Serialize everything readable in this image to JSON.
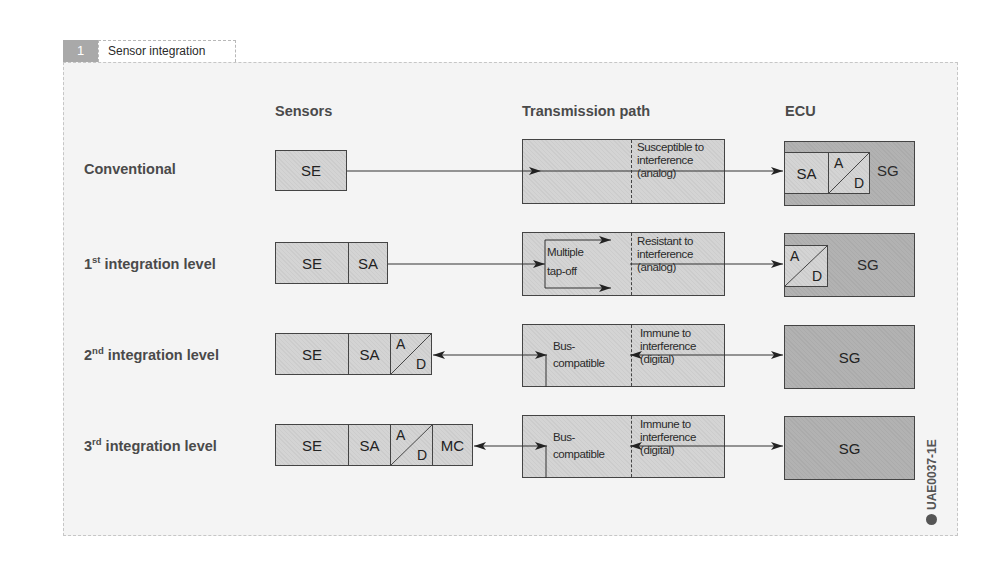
{
  "figure": {
    "number": "1",
    "title": "Sensor integration levels",
    "code": "UAE0037-1E"
  },
  "columns": {
    "sensors": "Sensors",
    "transmission": "Transmission path",
    "ecu": "ECU"
  },
  "rows": [
    {
      "label": "Conventional",
      "label_sup": "",
      "label_rest": "",
      "sensor_cells": [
        "SE"
      ],
      "transmission": {
        "left_text": "",
        "right_text": [
          "Susceptible to",
          "interference",
          "(analog)"
        ]
      },
      "ecu_cells": [
        "SA",
        "A/D",
        "SG"
      ]
    },
    {
      "label": "1",
      "label_sup": "st",
      "label_rest": " integration level",
      "sensor_cells": [
        "SE",
        "SA"
      ],
      "transmission": {
        "left_text": [
          "Multiple",
          "tap-off"
        ],
        "right_text": [
          "Resistant to",
          "interference",
          "(analog)"
        ]
      },
      "ecu_cells": [
        "A/D",
        "SG"
      ]
    },
    {
      "label": "2",
      "label_sup": "nd",
      "label_rest": " integration level",
      "sensor_cells": [
        "SE",
        "SA",
        "A/D"
      ],
      "transmission": {
        "left_text": [
          "Bus-",
          "compatible"
        ],
        "right_text": [
          "Immune to",
          "interference",
          "(digital)"
        ]
      },
      "ecu_cells": [
        "SG"
      ]
    },
    {
      "label": "3",
      "label_sup": "rd",
      "label_rest": " integration level",
      "sensor_cells": [
        "SE",
        "SA",
        "A/D",
        "MC"
      ],
      "transmission": {
        "left_text": [
          "Bus-",
          "compatible"
        ],
        "right_text": [
          "Immune to",
          "interference",
          "(digital)"
        ]
      },
      "ecu_cells": [
        "SG"
      ]
    }
  ],
  "ad": {
    "a": "A",
    "d": "D"
  },
  "colors": {
    "sensor_box": "#d4d4d4",
    "ecu_box": "#b2b2b2",
    "frame_bg": "#f4f4f4",
    "tab_num_bg": "#a9a9a9",
    "line": "#444444"
  }
}
